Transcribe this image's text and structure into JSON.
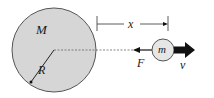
{
  "diagram": {
    "planet": {
      "label": "M",
      "radius_label": "R",
      "fill": "#d6d6d6",
      "stroke": "#555555"
    },
    "satellite": {
      "label": "m",
      "fill": "#e6e6e6",
      "stroke": "#555555"
    },
    "distance_label": "x",
    "force_label": "F",
    "velocity_label": "v",
    "colors": {
      "line": "#333333",
      "dashed": "#555555",
      "arrow": "#111111"
    }
  }
}
